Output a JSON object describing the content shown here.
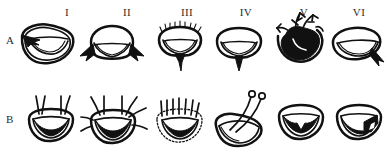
{
  "figure": {
    "type": "scientific-morphology-plate",
    "rows": [
      {
        "label": "A"
      },
      {
        "label": "B"
      }
    ],
    "columns": [
      {
        "label": "I"
      },
      {
        "label": "II"
      },
      {
        "label": "III"
      },
      {
        "label": "IV"
      },
      {
        "label": "V"
      },
      {
        "label": "VI"
      }
    ],
    "colors": {
      "ink": "#111111",
      "background": "#ffffff",
      "label": "#2b2b2b"
    },
    "specimens": [
      {
        "id": "A-I",
        "row": "A",
        "column": "I",
        "features": "broad crescent with doubled concentric outline and arrow-like pointed process on upper left"
      },
      {
        "id": "A-II",
        "row": "A",
        "column": "II",
        "features": "rounded cap outline with solid black triangular spines projecting from both lower corners"
      },
      {
        "id": "A-III",
        "row": "A",
        "column": "III",
        "features": "rounded outline with fringed hairy upper margin and long black median spine below"
      },
      {
        "id": "A-IV",
        "row": "A",
        "column": "IV",
        "features": "smooth rounded outline with slender black median spine descending from centre"
      },
      {
        "id": "A-V",
        "row": "A",
        "column": "V",
        "features": "heavily infuscate solid black body with branched antler-like apical processes"
      },
      {
        "id": "A-VI",
        "row": "A",
        "column": "VI",
        "features": "oblique oval outline with single black spine at lower right margin"
      },
      {
        "id": "B-I",
        "row": "B",
        "column": "I",
        "features": "rounded cup with two erect apical setae and thick black internal crescent band"
      },
      {
        "id": "B-II",
        "row": "B",
        "column": "II",
        "features": "rounded cup with numerous radiating setae on apex and sides, black internal crescent"
      },
      {
        "id": "B-III",
        "row": "B",
        "column": "III",
        "features": "dotted broken outline with comb of short erect setae and black internal crescent"
      },
      {
        "id": "B-IV",
        "row": "B",
        "column": "IV",
        "features": "oblique tilted outline with two slender stalks bearing small terminal knobs"
      },
      {
        "id": "B-V",
        "row": "B",
        "column": "V",
        "features": "simple rounded outline enclosing a black crown-shaped jagged marking"
      },
      {
        "id": "B-VI",
        "row": "B",
        "column": "VI",
        "features": "rounded outline with broad black oblique band and pale notch at lower right"
      }
    ]
  }
}
